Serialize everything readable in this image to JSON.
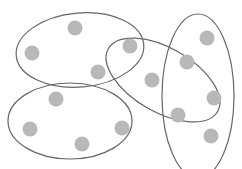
{
  "diagram": {
    "type": "hypergraph-ellipses",
    "node_color": "#b8b8b8",
    "edge_color": "#666666",
    "nodes": [
      {
        "id": "n1",
        "x": 75,
        "y": 28
      },
      {
        "id": "n2",
        "x": 32,
        "y": 53
      },
      {
        "id": "n3",
        "x": 98,
        "y": 72
      },
      {
        "id": "n4",
        "x": 130,
        "y": 46
      },
      {
        "id": "n5",
        "x": 152,
        "y": 80
      },
      {
        "id": "n6",
        "x": 187,
        "y": 62
      },
      {
        "id": "n7",
        "x": 207,
        "y": 38
      },
      {
        "id": "n8",
        "x": 214,
        "y": 98
      },
      {
        "id": "n9",
        "x": 178,
        "y": 115
      },
      {
        "id": "n10",
        "x": 211,
        "y": 136
      },
      {
        "id": "n11",
        "x": 56,
        "y": 99
      },
      {
        "id": "n12",
        "x": 30,
        "y": 129
      },
      {
        "id": "n13",
        "x": 82,
        "y": 144
      },
      {
        "id": "n14",
        "x": 122,
        "y": 128
      }
    ],
    "hyperedges": [
      {
        "id": "e1",
        "cx": 80,
        "cy": 50,
        "rx": 64,
        "ry": 37,
        "rotate": -5,
        "members": [
          "n1",
          "n2",
          "n3"
        ]
      },
      {
        "id": "e2",
        "cx": 70,
        "cy": 121,
        "rx": 62,
        "ry": 38,
        "rotate": 0,
        "members": [
          "n11",
          "n12",
          "n13",
          "n14"
        ]
      },
      {
        "id": "e3",
        "cx": 163,
        "cy": 80,
        "rx": 63,
        "ry": 32,
        "rotate": 30,
        "members": [
          "n4",
          "n5",
          "n6",
          "n9"
        ]
      },
      {
        "id": "e4",
        "cx": 198,
        "cy": 96,
        "rx": 36,
        "ry": 82,
        "rotate": 0,
        "members": [
          "n6",
          "n7",
          "n8",
          "n9",
          "n10"
        ]
      }
    ]
  }
}
